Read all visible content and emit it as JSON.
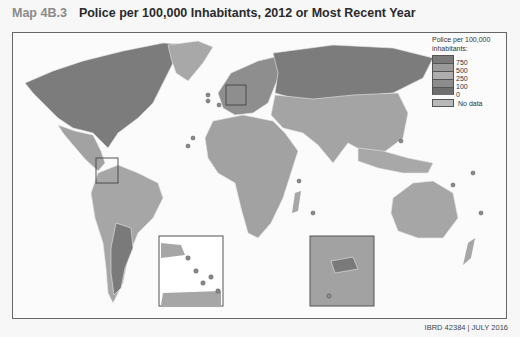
{
  "header": {
    "map_number": "Map 4B.3",
    "title": "Police per 100,000 Inhabitants, 2012 or Most Recent Year"
  },
  "legend": {
    "title_line1": "Police per 100,000",
    "title_line2": "inhabitants:",
    "classes": [
      {
        "label": "750",
        "color": "#7a7a7a"
      },
      {
        "label": "500",
        "color": "#9a9a9a"
      },
      {
        "label": "250",
        "color": "#aeaeae"
      },
      {
        "label": "100",
        "color": "#8c8c8c"
      },
      {
        "label": "0",
        "color": "#6e6e6e"
      }
    ],
    "no_data": {
      "label": "No data",
      "color": "#b8b8b8"
    }
  },
  "colors": {
    "ocean": "#fbfbfb",
    "land_high": "#7c7c7c",
    "land_mid": "#a2a2a2",
    "land_low": "#b0b0b0",
    "border": "#e8e8e8",
    "frame": "#666666"
  },
  "footer": {
    "credit": "IBRD 42384 | JULY 2016"
  }
}
